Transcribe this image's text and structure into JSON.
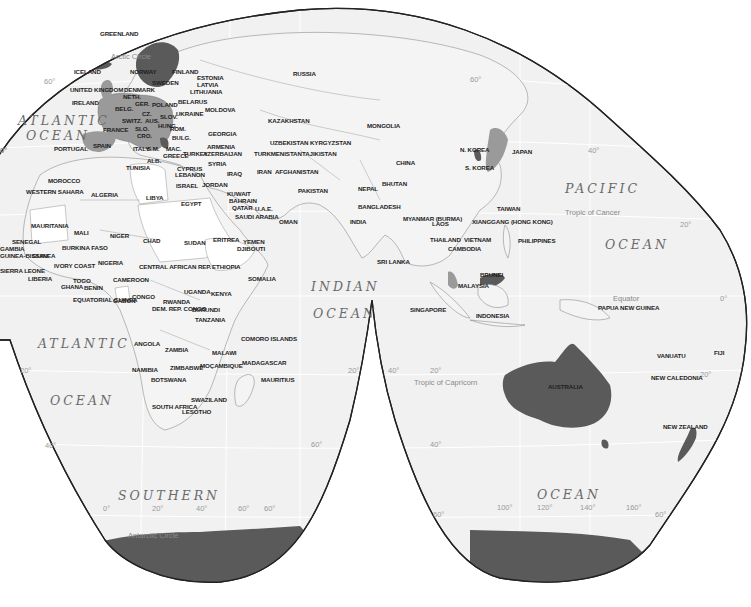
{
  "map": {
    "title": "World political map (interrupted projection)",
    "colors": {
      "ocean": "#f2f2f2",
      "land": "#f4f4f4",
      "highlight_mid": "#9a9a9a",
      "highlight_dark": "#5a5a5a",
      "antarctica": "#5c5c5c",
      "outline": "#222222",
      "border": "#7a7a7a"
    },
    "oceans": [
      {
        "id": "atlantic-north-1",
        "text": "ATLANTIC"
      },
      {
        "id": "atlantic-north-2",
        "text": "OCEAN"
      },
      {
        "id": "pacific-1",
        "text": "PACIFIC"
      },
      {
        "id": "pacific-2",
        "text": "OCEAN"
      },
      {
        "id": "indian-1",
        "text": "INDIAN"
      },
      {
        "id": "indian-2",
        "text": "OCEAN"
      },
      {
        "id": "atlantic-south-1",
        "text": "ATLANTIC"
      },
      {
        "id": "atlantic-south-2",
        "text": "OCEAN"
      },
      {
        "id": "southern",
        "text": "SOUTHERN"
      },
      {
        "id": "southern-ocean-2",
        "text": "OCEAN"
      }
    ],
    "reference_lines": {
      "arctic_circle": "Arctic Circle",
      "tropic_cancer": "Tropic of Cancer",
      "equator": "Equator",
      "tropic_capricorn": "Tropic of Capricorn",
      "antarctic_circle": "Antarctic Circle"
    },
    "graticule_labels": [
      "60°",
      "0°",
      "40°",
      "20°",
      "0°",
      "20°",
      "40°",
      "20°",
      "40°",
      "60°",
      "0°",
      "20°",
      "40°",
      "60°",
      "60°",
      "60°",
      "100°",
      "120°",
      "140°",
      "160°",
      "60°",
      "20°",
      "0°",
      "20°",
      "40°",
      "60°"
    ],
    "countries": [
      "GREENLAND",
      "ICELAND",
      "NORWAY",
      "FINLAND",
      "ESTONIA",
      "LATVIA",
      "LITHUANIA",
      "SWEDEN",
      "DENMARK",
      "NETH.",
      "UNITED KINGDOM",
      "IRELAND",
      "BELG.",
      "GER.",
      "POLAND",
      "BELARUS",
      "CZ.",
      "SLOV.",
      "AUS.",
      "HUNG.",
      "SWITZ.",
      "SLO.",
      "CRO.",
      "UKRAINE",
      "MOLDOVA",
      "ROM.",
      "BULG.",
      "FRANCE",
      "SPAIN",
      "PORTUGAL",
      "ITALY",
      "S.M.",
      "ALB.",
      "GREECE",
      "MAC.",
      "TURKEY",
      "GEORGIA",
      "ARMENIA",
      "AZERBAIJAN",
      "CYPRUS",
      "LEBANON",
      "SYRIA",
      "ISRAEL",
      "JORDAN",
      "IRAQ",
      "IRAN",
      "KUWAIT",
      "BAHRAIN",
      "QATAR",
      "U.A.E.",
      "SAUDI ARABIA",
      "OMAN",
      "YEMEN",
      "DJIBOUTI",
      "ERITREA",
      "RUSSIA",
      "KAZAKHSTAN",
      "UZBEKISTAN",
      "KYRGYZSTAN",
      "TURKMENISTAN",
      "TAJIKISTAN",
      "AFGHANISTAN",
      "PAKISTAN",
      "MONGOLIA",
      "CHINA",
      "N. KOREA",
      "S. KOREA",
      "JAPAN",
      "NEPAL",
      "BHUTAN",
      "BANGLADESH",
      "INDIA",
      "SRI LANKA",
      "MYANMAR (BURMA)",
      "LAOS",
      "THAILAND",
      "VIETNAM",
      "CAMBODIA",
      "XIANGGANG (HONG KONG)",
      "TAIWAN",
      "PHILIPPINES",
      "MALAYSIA",
      "BRUNEI",
      "SINGAPORE",
      "INDONESIA",
      "PAPUA NEW GUINEA",
      "AUSTRALIA",
      "VANUATU",
      "FIJI",
      "NEW CALEDONIA",
      "NEW ZEALAND",
      "TUNISIA",
      "MOROCCO",
      "ALGERIA",
      "LIBYA",
      "EGYPT",
      "WESTERN SAHARA",
      "MAURITANIA",
      "MALI",
      "NIGER",
      "CHAD",
      "SUDAN",
      "ETHIOPIA",
      "SOMALIA",
      "SENEGAL",
      "GAMBIA",
      "GUINEA-BISSAU",
      "GUINEA",
      "SIERRA LEONE",
      "LIBERIA",
      "IVORY COAST",
      "BURKINA FASO",
      "GHANA",
      "TOGO",
      "BENIN",
      "NIGERIA",
      "CAMEROON",
      "CENTRAL AFRICAN REP.",
      "EQUATORIAL GUINEA",
      "GABON",
      "CONGO",
      "DEM. REP. CONGO",
      "UGANDA",
      "KENYA",
      "RWANDA",
      "BURUNDI",
      "TANZANIA",
      "ANGOLA",
      "ZAMBIA",
      "MALAWI",
      "NAMIBIA",
      "ZIMBABWE",
      "MOÇAMBIQUE",
      "BOTSWANA",
      "SWAZILAND",
      "SOUTH AFRICA",
      "LESOTHO",
      "MADAGASCAR",
      "COMORO ISLANDS",
      "MAURITIUS"
    ]
  }
}
